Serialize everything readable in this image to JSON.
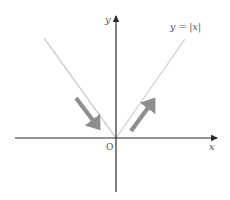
{
  "diagram": {
    "labels": {
      "y_axis": "y",
      "x_axis": "x",
      "origin": "O",
      "function": "y = |x|"
    },
    "colors": {
      "axis": "#2b2b2b",
      "function_line": "#cfcfcf",
      "direction_arrow": "#8e8e8e",
      "label": "#555555"
    },
    "elements": [
      {
        "type": "axis",
        "name": "x-axis",
        "direction": "horizontal",
        "arrowhead": "right"
      },
      {
        "type": "axis",
        "name": "y-axis",
        "direction": "vertical",
        "arrowhead": "top"
      },
      {
        "type": "line",
        "name": "left-branch",
        "description": "y = -x for x < 0"
      },
      {
        "type": "line",
        "name": "right-branch",
        "description": "y = x for x > 0"
      },
      {
        "type": "arrow",
        "name": "decreasing-arrow",
        "description": "points down toward origin along left branch"
      },
      {
        "type": "arrow",
        "name": "increasing-arrow",
        "description": "points up away from origin along right branch"
      }
    ]
  }
}
